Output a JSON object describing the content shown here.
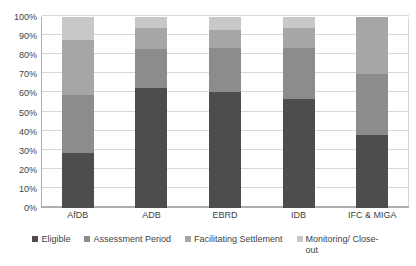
{
  "chart_data": {
    "type": "bar",
    "subtype": "stacked-bar-100-percent",
    "title": "",
    "subtitle": "",
    "xlabel": "",
    "ylabel": "",
    "ylim": [
      0,
      100
    ],
    "y_unit": "%",
    "grid": true,
    "legend_position": "bottom",
    "categories": [
      "AfDB",
      "ADB",
      "EBRD",
      "IDB",
      "IFC & MIGA"
    ],
    "y_tick_labels": [
      "100%",
      "90%",
      "80%",
      "70%",
      "60%",
      "50%",
      "40%",
      "30%",
      "20%",
      "10%",
      "0%"
    ],
    "y_tick_values": [
      100,
      90,
      80,
      70,
      60,
      50,
      40,
      30,
      20,
      10,
      0
    ],
    "series": [
      {
        "name": "Eligible",
        "color": "#4d4d4d",
        "values": [
          29,
          63,
          61,
          57,
          38
        ]
      },
      {
        "name": "Assessment Period",
        "color": "#8c8c8c",
        "values": [
          30,
          20,
          23,
          27,
          32
        ]
      },
      {
        "name": "Facilitating Settlement",
        "color": "#a6a6a6",
        "values": [
          29,
          11,
          9,
          10,
          30
        ]
      },
      {
        "name": "Monitoring/ Close-out",
        "color": "#c8c8c8",
        "values": [
          12,
          6,
          7,
          6,
          0
        ]
      }
    ]
  },
  "legend": {
    "items": [
      {
        "label": "Eligible",
        "color": "#4d4d4d"
      },
      {
        "label": "Assessment Period",
        "color": "#8c8c8c"
      },
      {
        "label": "Facilitating Settlement",
        "color": "#a6a6a6"
      },
      {
        "label": "Monitoring/ Close-out",
        "color": "#c8c8c8"
      }
    ]
  }
}
